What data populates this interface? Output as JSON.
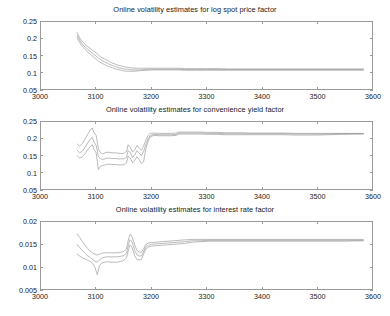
{
  "figure": {
    "background": "#ffffff",
    "axis_color": "#9a9a9a",
    "text_color": "#1a1a1a"
  },
  "chart_data": [
    {
      "type": "line",
      "title": "Online volatility estimates for log spot price factor",
      "xlabel": "",
      "ylabel": "",
      "xlim": [
        3000,
        3600
      ],
      "ylim": [
        0.05,
        0.25
      ],
      "xticks": [
        3000,
        3100,
        3200,
        3300,
        3400,
        3500,
        3600
      ],
      "yticks": [
        0.05,
        0.1,
        0.15,
        0.2,
        0.25
      ],
      "xtick_labels": [
        "3000",
        "3100",
        "3200",
        "3300",
        "3400",
        "3500",
        "3600"
      ],
      "ytick_labels": [
        "0.05",
        "0.1",
        "0.15",
        "0.2",
        "0.25"
      ],
      "grid": false,
      "legend": "none",
      "line_color": "#8d8d8d",
      "x": [
        3065,
        3070,
        3075,
        3080,
        3085,
        3090,
        3095,
        3100,
        3105,
        3110,
        3115,
        3120,
        3125,
        3130,
        3135,
        3140,
        3145,
        3150,
        3155,
        3160,
        3165,
        3170,
        3175,
        3180,
        3185,
        3190,
        3195,
        3200,
        3210,
        3220,
        3230,
        3240,
        3250,
        3260,
        3280,
        3300,
        3320,
        3340,
        3360,
        3380,
        3400,
        3430,
        3460,
        3490,
        3520,
        3550,
        3585
      ],
      "series": [
        {
          "name": "upper band",
          "values": [
            0.22,
            0.203,
            0.192,
            0.183,
            0.176,
            0.17,
            0.163,
            0.158,
            0.15,
            0.144,
            0.14,
            0.136,
            0.131,
            0.127,
            0.124,
            0.121,
            0.119,
            0.117,
            0.115,
            0.114,
            0.113,
            0.112,
            0.112,
            0.112,
            0.112,
            0.112,
            0.112,
            0.112,
            0.112,
            0.112,
            0.112,
            0.112,
            0.112,
            0.111,
            0.111,
            0.111,
            0.111,
            0.11,
            0.11,
            0.11,
            0.11,
            0.11,
            0.11,
            0.11,
            0.11,
            0.11,
            0.11
          ]
        },
        {
          "name": "central estimate",
          "values": [
            0.212,
            0.196,
            0.184,
            0.175,
            0.168,
            0.161,
            0.154,
            0.148,
            0.141,
            0.136,
            0.131,
            0.127,
            0.123,
            0.12,
            0.117,
            0.114,
            0.112,
            0.11,
            0.109,
            0.108,
            0.107,
            0.107,
            0.107,
            0.107,
            0.108,
            0.108,
            0.109,
            0.109,
            0.109,
            0.109,
            0.109,
            0.109,
            0.109,
            0.108,
            0.108,
            0.108,
            0.108,
            0.108,
            0.108,
            0.108,
            0.108,
            0.108,
            0.108,
            0.108,
            0.108,
            0.108,
            0.108
          ]
        },
        {
          "name": "lower band",
          "values": [
            0.205,
            0.189,
            0.177,
            0.168,
            0.16,
            0.153,
            0.146,
            0.139,
            0.132,
            0.127,
            0.123,
            0.119,
            0.116,
            0.113,
            0.11,
            0.108,
            0.106,
            0.104,
            0.103,
            0.103,
            0.103,
            0.103,
            0.104,
            0.105,
            0.105,
            0.106,
            0.106,
            0.107,
            0.107,
            0.107,
            0.107,
            0.107,
            0.107,
            0.106,
            0.106,
            0.106,
            0.106,
            0.106,
            0.106,
            0.106,
            0.106,
            0.106,
            0.106,
            0.106,
            0.106,
            0.106,
            0.106
          ]
        }
      ]
    },
    {
      "type": "line",
      "title": "Online volatility estimates for convenience yield factor",
      "xlabel": "",
      "ylabel": "",
      "xlim": [
        3000,
        3600
      ],
      "ylim": [
        0.05,
        0.25
      ],
      "xticks": [
        3000,
        3100,
        3200,
        3300,
        3400,
        3500,
        3600
      ],
      "yticks": [
        0.05,
        0.1,
        0.15,
        0.2,
        0.25
      ],
      "xtick_labels": [
        "3000",
        "3100",
        "3200",
        "3300",
        "3400",
        "3500",
        "3600"
      ],
      "ytick_labels": [
        "0.05",
        "0.1",
        "0.15",
        "0.2",
        "0.25"
      ],
      "grid": false,
      "legend": "none",
      "line_color": "#8d8d8d",
      "x": [
        3065,
        3070,
        3075,
        3080,
        3085,
        3090,
        3093,
        3096,
        3100,
        3104,
        3108,
        3112,
        3116,
        3120,
        3125,
        3130,
        3135,
        3140,
        3145,
        3150,
        3155,
        3158,
        3162,
        3166,
        3170,
        3174,
        3178,
        3182,
        3186,
        3190,
        3194,
        3198,
        3205,
        3215,
        3225,
        3235,
        3245,
        3250,
        3260,
        3275,
        3290,
        3305,
        3320,
        3335,
        3350,
        3365,
        3380,
        3400,
        3420,
        3440,
        3460,
        3480,
        3500,
        3520,
        3545,
        3570,
        3585
      ],
      "series": [
        {
          "name": "upper band",
          "values": [
            0.185,
            0.178,
            0.186,
            0.2,
            0.214,
            0.228,
            0.232,
            0.218,
            0.21,
            0.17,
            0.158,
            0.155,
            0.158,
            0.16,
            0.159,
            0.158,
            0.158,
            0.157,
            0.156,
            0.156,
            0.162,
            0.182,
            0.175,
            0.16,
            0.168,
            0.18,
            0.172,
            0.166,
            0.178,
            0.196,
            0.21,
            0.216,
            0.217,
            0.216,
            0.216,
            0.216,
            0.217,
            0.22,
            0.22,
            0.22,
            0.22,
            0.219,
            0.219,
            0.218,
            0.218,
            0.218,
            0.217,
            0.217,
            0.217,
            0.217,
            0.216,
            0.216,
            0.216,
            0.216,
            0.216,
            0.216,
            0.216
          ]
        },
        {
          "name": "central estimate",
          "values": [
            0.166,
            0.158,
            0.163,
            0.175,
            0.188,
            0.2,
            0.204,
            0.19,
            0.18,
            0.148,
            0.14,
            0.138,
            0.14,
            0.142,
            0.142,
            0.141,
            0.141,
            0.14,
            0.14,
            0.14,
            0.145,
            0.165,
            0.158,
            0.144,
            0.152,
            0.164,
            0.156,
            0.15,
            0.162,
            0.182,
            0.2,
            0.21,
            0.213,
            0.212,
            0.212,
            0.212,
            0.213,
            0.217,
            0.217,
            0.217,
            0.217,
            0.216,
            0.216,
            0.215,
            0.215,
            0.215,
            0.215,
            0.215,
            0.215,
            0.215,
            0.214,
            0.214,
            0.214,
            0.214,
            0.215,
            0.215,
            0.215
          ]
        },
        {
          "name": "lower band",
          "values": [
            0.15,
            0.142,
            0.146,
            0.156,
            0.168,
            0.178,
            0.182,
            0.168,
            0.158,
            0.108,
            0.118,
            0.12,
            0.122,
            0.124,
            0.124,
            0.123,
            0.123,
            0.122,
            0.122,
            0.122,
            0.128,
            0.148,
            0.142,
            0.128,
            0.136,
            0.146,
            0.138,
            0.126,
            0.132,
            0.17,
            0.192,
            0.206,
            0.21,
            0.209,
            0.209,
            0.209,
            0.21,
            0.214,
            0.214,
            0.214,
            0.214,
            0.213,
            0.213,
            0.212,
            0.212,
            0.212,
            0.212,
            0.212,
            0.212,
            0.212,
            0.211,
            0.211,
            0.211,
            0.212,
            0.213,
            0.214,
            0.214
          ]
        }
      ]
    },
    {
      "type": "line",
      "title": "Online volatility estimates for interest rate factor",
      "xlabel": "",
      "ylabel": "",
      "xlim": [
        3000,
        3600
      ],
      "ylim": [
        0.005,
        0.02
      ],
      "xticks": [
        3000,
        3100,
        3200,
        3300,
        3400,
        3500,
        3600
      ],
      "yticks": [
        0.005,
        0.01,
        0.015,
        0.02
      ],
      "xtick_labels": [
        "3000",
        "3100",
        "3200",
        "3300",
        "3400",
        "3500",
        "3600"
      ],
      "ytick_labels": [
        "0.005",
        "0.01",
        "0.015",
        "0.02"
      ],
      "grid": false,
      "legend": "none",
      "line_color": "#8d8d8d",
      "x": [
        3065,
        3070,
        3075,
        3080,
        3085,
        3090,
        3094,
        3098,
        3102,
        3106,
        3110,
        3115,
        3120,
        3126,
        3132,
        3138,
        3144,
        3150,
        3155,
        3158,
        3161,
        3164,
        3167,
        3170,
        3174,
        3178,
        3182,
        3186,
        3190,
        3195,
        3200,
        3210,
        3220,
        3230,
        3240,
        3250,
        3260,
        3275,
        3290,
        3305,
        3320,
        3340,
        3360,
        3380,
        3400,
        3430,
        3460,
        3490,
        3520,
        3550,
        3585
      ],
      "series": [
        {
          "name": "upper band",
          "values": [
            0.0174,
            0.0166,
            0.0156,
            0.0148,
            0.014,
            0.0134,
            0.013,
            0.0128,
            0.0126,
            0.0128,
            0.013,
            0.0131,
            0.0131,
            0.0131,
            0.0131,
            0.0131,
            0.0132,
            0.0134,
            0.014,
            0.0158,
            0.0172,
            0.017,
            0.016,
            0.0148,
            0.0136,
            0.0133,
            0.0132,
            0.014,
            0.015,
            0.0153,
            0.0154,
            0.0155,
            0.0156,
            0.0157,
            0.0158,
            0.0159,
            0.016,
            0.0161,
            0.0161,
            0.0161,
            0.0161,
            0.0161,
            0.0161,
            0.0161,
            0.0161,
            0.0161,
            0.0161,
            0.0161,
            0.0161,
            0.0161,
            0.0161
          ]
        },
        {
          "name": "central estimate",
          "values": [
            0.015,
            0.0143,
            0.0136,
            0.013,
            0.0124,
            0.012,
            0.0116,
            0.0112,
            0.011,
            0.0115,
            0.0119,
            0.0121,
            0.0122,
            0.0122,
            0.0122,
            0.0122,
            0.0123,
            0.0125,
            0.013,
            0.0146,
            0.016,
            0.0158,
            0.0148,
            0.0136,
            0.0126,
            0.0124,
            0.0124,
            0.0134,
            0.0145,
            0.0148,
            0.015,
            0.0151,
            0.0152,
            0.0153,
            0.0154,
            0.0155,
            0.0156,
            0.0158,
            0.0158,
            0.0159,
            0.0159,
            0.0159,
            0.0159,
            0.0159,
            0.0159,
            0.0159,
            0.0159,
            0.0159,
            0.0159,
            0.0159,
            0.0159
          ]
        },
        {
          "name": "lower band",
          "values": [
            0.0128,
            0.0124,
            0.012,
            0.0117,
            0.0114,
            0.0111,
            0.0106,
            0.0098,
            0.0082,
            0.0102,
            0.0108,
            0.011,
            0.0111,
            0.011,
            0.011,
            0.011,
            0.0112,
            0.0114,
            0.012,
            0.0134,
            0.0148,
            0.0146,
            0.0136,
            0.0124,
            0.0116,
            0.0115,
            0.0116,
            0.0128,
            0.014,
            0.0144,
            0.0146,
            0.0147,
            0.0148,
            0.0149,
            0.015,
            0.0151,
            0.0152,
            0.0155,
            0.0156,
            0.0157,
            0.0157,
            0.0157,
            0.0157,
            0.0157,
            0.0157,
            0.0157,
            0.0157,
            0.0157,
            0.0157,
            0.0157,
            0.0158
          ]
        }
      ]
    }
  ]
}
